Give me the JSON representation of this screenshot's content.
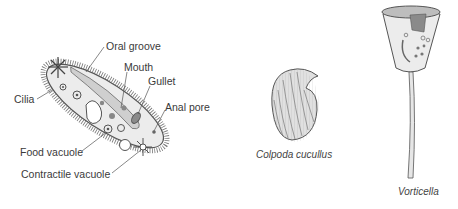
{
  "paramecium": {
    "labels": {
      "oral_groove": "Oral groove",
      "mouth": "Mouth",
      "gullet": "Gullet",
      "anal_pore": "Anal pore",
      "cilia": "Cilia",
      "food_vacuole": "Food vacuole",
      "contractile_vacuole": "Contractile vacuole"
    }
  },
  "colpoda": {
    "caption": "Colpoda cucullus"
  },
  "vorticella": {
    "caption": "Vorticella"
  },
  "colors": {
    "outline": "#555555",
    "body_fill": "#ececec",
    "organelle": "#8a8a8a",
    "text": "#3a3a3a"
  }
}
